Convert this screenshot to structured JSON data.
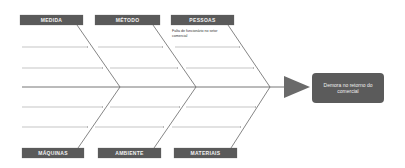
{
  "diagram": {
    "type": "fishbone",
    "effect": "Demora no retorno do comercial",
    "categories_top": [
      {
        "label": "MEDIDA"
      },
      {
        "label": "MÉTODO"
      },
      {
        "label": "PESSOAS"
      }
    ],
    "categories_bottom": [
      {
        "label": "MÁQUINAS"
      },
      {
        "label": "AMBIENTE"
      },
      {
        "label": "MATERIAIS"
      }
    ],
    "causes": {
      "pessoas": "Falta de funcionário no setor comercial"
    },
    "colors": {
      "box": "#5a5a5a",
      "line": "#777777",
      "text": "#f2f2f2"
    }
  }
}
